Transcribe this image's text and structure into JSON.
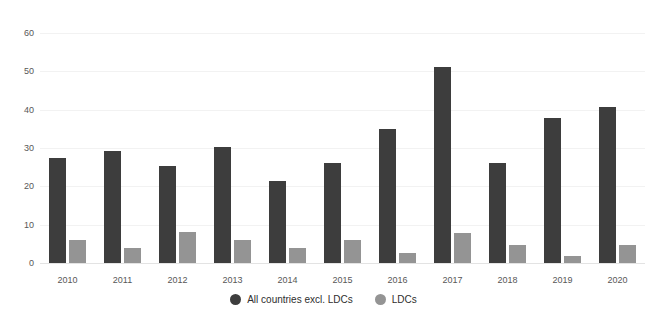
{
  "chart_data": {
    "type": "bar",
    "title": "",
    "subtitle": "",
    "xlabel": "",
    "ylabel": "",
    "categories": [
      "2010",
      "2011",
      "2012",
      "2013",
      "2014",
      "2015",
      "2016",
      "2017",
      "2018",
      "2019",
      "2020"
    ],
    "series": [
      {
        "name": "All countries excl. LDCs",
        "color": "#3d3d3d",
        "marker": "circle",
        "values": [
          27.4,
          29.2,
          25.3,
          30.2,
          21.3,
          26.1,
          35.0,
          51.2,
          26.0,
          37.7,
          40.8
        ]
      },
      {
        "name": "LDCs",
        "color": "#949494",
        "marker": "circle",
        "values": [
          6.0,
          3.9,
          8.1,
          6.0,
          3.9,
          6.1,
          2.6,
          7.9,
          4.8,
          1.7,
          4.8
        ]
      }
    ],
    "ylim": [
      0,
      60
    ],
    "yticks": [
      0,
      10,
      20,
      30,
      40,
      50,
      60
    ],
    "ytick_labels": [
      "0",
      "10",
      "20",
      "30",
      "40",
      "50",
      "60"
    ],
    "grid": true,
    "grid_axis": "y",
    "legend_position": "bottom-center",
    "background_color": "#ffffff",
    "gridline_color": "#f2f2f2",
    "axis_color": "#e3e3e3"
  }
}
